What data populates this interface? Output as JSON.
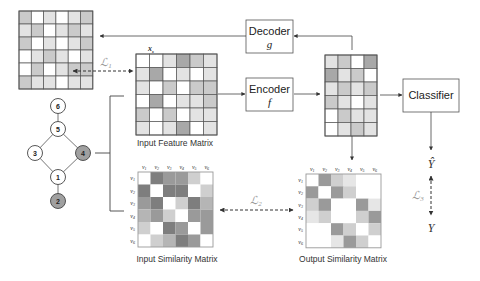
{
  "boxes": {
    "decoder": {
      "label": "Decoder",
      "var": "g"
    },
    "encoder": {
      "label": "Encoder",
      "var": "f"
    },
    "classifier": {
      "label": "Classifier"
    }
  },
  "captions": {
    "input_feature": "Input Feature Matrix",
    "input_similarity": "Input Similarity Matrix",
    "output_similarity": "Output Similarity Matrix"
  },
  "feature_label": "x_s",
  "losses": {
    "l1": "L1",
    "l2": "L2",
    "l3": "L3"
  },
  "outputs": {
    "y_hat": "Ŷ",
    "y": "Y"
  },
  "graph": {
    "nodes": [
      {
        "id": "6",
        "shaded": false
      },
      {
        "id": "5",
        "shaded": false
      },
      {
        "id": "3",
        "shaded": false
      },
      {
        "id": "4",
        "shaded": true
      },
      {
        "id": "1",
        "shaded": false
      },
      {
        "id": "2",
        "shaded": true
      }
    ],
    "edges": [
      [
        "6",
        "5"
      ],
      [
        "5",
        "3"
      ],
      [
        "5",
        "4"
      ],
      [
        "3",
        "1"
      ],
      [
        "4",
        "1"
      ],
      [
        "1",
        "2"
      ]
    ]
  },
  "similarity_axis_labels": [
    "v1",
    "v2",
    "v3",
    "v4",
    "v5",
    "v6"
  ],
  "matrices": {
    "reconstructed": [
      [
        2,
        0,
        1,
        0,
        1,
        2
      ],
      [
        1,
        2,
        0,
        1,
        2,
        1
      ],
      [
        2,
        0,
        1,
        0,
        1,
        2
      ],
      [
        0,
        1,
        2,
        1,
        0,
        1
      ],
      [
        0,
        2,
        0,
        1,
        2,
        2
      ],
      [
        2,
        1,
        1,
        0,
        1,
        1
      ]
    ],
    "input_feature": [
      [
        0,
        0,
        1,
        3,
        2,
        1
      ],
      [
        1,
        3,
        0,
        1,
        0,
        1
      ],
      [
        1,
        0,
        2,
        0,
        2,
        2
      ],
      [
        0,
        3,
        0,
        1,
        1,
        2
      ],
      [
        2,
        0,
        2,
        0,
        1,
        1
      ],
      [
        1,
        0,
        1,
        3,
        0,
        1
      ]
    ],
    "latent": [
      [
        1,
        2,
        0,
        3
      ],
      [
        3,
        1,
        2,
        0
      ],
      [
        1,
        2,
        1,
        2
      ],
      [
        2,
        1,
        0,
        1
      ],
      [
        0,
        2,
        1,
        1
      ],
      [
        0,
        1,
        2,
        1
      ]
    ],
    "input_similarity": [
      [
        0,
        5,
        4,
        4,
        2,
        0
      ],
      [
        5,
        0,
        5,
        5,
        0,
        2
      ],
      [
        4,
        5,
        0,
        2,
        5,
        3
      ],
      [
        3,
        4,
        2,
        0,
        4,
        4
      ],
      [
        2,
        0,
        5,
        4,
        0,
        4
      ],
      [
        0,
        2,
        3,
        5,
        4,
        0
      ]
    ],
    "output_similarity": [
      [
        0,
        4,
        2,
        1,
        0,
        0
      ],
      [
        4,
        0,
        4,
        2,
        0,
        0
      ],
      [
        2,
        4,
        0,
        0,
        4,
        1
      ],
      [
        1,
        2,
        0,
        0,
        2,
        4
      ],
      [
        0,
        0,
        4,
        2,
        0,
        2
      ],
      [
        0,
        0,
        1,
        4,
        2,
        0
      ]
    ]
  },
  "colors": {
    "feature_shades": [
      "#ffffff",
      "#e3e3e3",
      "#cacaca",
      "#a8a8a8"
    ],
    "similarity_shades": [
      "#ffffff",
      "#e6e6e6",
      "#cfcfcf",
      "#b5b5b5",
      "#9a9a9a",
      "#7e7e7e"
    ],
    "grid_line": "#555555",
    "node_shaded": "#a0a0a0"
  }
}
